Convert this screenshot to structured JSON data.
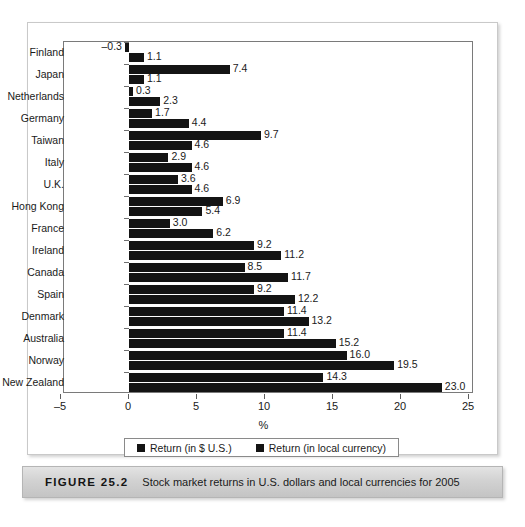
{
  "figure": {
    "number": "FIGURE 25.2",
    "caption": "Stock market returns in U.S. dollars and local currencies for 2005"
  },
  "legend": {
    "items": [
      {
        "label": "Return (in $ U.S.)",
        "color": "#141414"
      },
      {
        "label": "Return (in local currency)",
        "color": "#141414"
      }
    ]
  },
  "chart_data": {
    "type": "bar",
    "orientation": "horizontal",
    "title": "Stock market returns in U.S. dollars and local currencies for 2005",
    "xlabel": "%",
    "ylabel": "",
    "xlim": [
      -5,
      25
    ],
    "xticks": [
      -5,
      0,
      5,
      10,
      15,
      20,
      25
    ],
    "xtick_labels": [
      "–5",
      "0",
      "5",
      "10",
      "15",
      "20",
      "25"
    ],
    "grid": false,
    "legend_position": "bottom",
    "categories": [
      "Finland",
      "Japan",
      "Netherlands",
      "Germany",
      "Taiwan",
      "Italy",
      "U.K.",
      "Hong Kong",
      "France",
      "Ireland",
      "Canada",
      "Spain",
      "Denmark",
      "Australia",
      "Norway",
      "New Zealand"
    ],
    "series": [
      {
        "name": "Return (in $ U.S.)",
        "color": "#141414",
        "values": [
          -0.3,
          7.4,
          0.3,
          1.7,
          9.7,
          2.9,
          3.6,
          6.9,
          3.0,
          9.2,
          8.5,
          9.2,
          11.4,
          11.4,
          16.0,
          14.3
        ],
        "labels": [
          "–0.3",
          "7.4",
          "0.3",
          "1.7",
          "9.7",
          "2.9",
          "3.6",
          "6.9",
          "3.0",
          "9.2",
          "8.5",
          "9.2",
          "11.4",
          "11.4",
          "16.0",
          "14.3"
        ]
      },
      {
        "name": "Return (in local currency)",
        "color": "#141414",
        "values": [
          1.1,
          1.1,
          2.3,
          4.4,
          4.6,
          4.6,
          4.6,
          5.4,
          6.2,
          11.2,
          11.7,
          12.2,
          13.2,
          15.2,
          19.5,
          23.0
        ],
        "labels": [
          "1.1",
          "1.1",
          "2.3",
          "4.4",
          "4.6",
          "4.6",
          "4.6",
          "5.4",
          "6.2",
          "11.2",
          "11.7",
          "12.2",
          "13.2",
          "15.2",
          "19.5",
          "23.0"
        ]
      }
    ]
  }
}
